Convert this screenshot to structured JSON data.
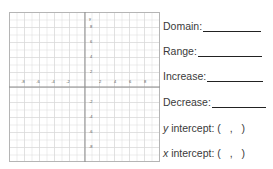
{
  "worksheet": {
    "fields": [
      {
        "label": "Domain:",
        "blank_width": 58
      },
      {
        "label": "Range:",
        "blank_width": 64
      },
      {
        "label": "Increase:",
        "blank_width": 56
      },
      {
        "label": "Decrease:",
        "blank_width": 54
      }
    ],
    "intercepts": [
      {
        "variable": "y",
        "label": " intercept:",
        "value": "(  ,  )"
      },
      {
        "variable": "x",
        "label": " intercept:",
        "value": "(  ,  )"
      }
    ]
  },
  "graph": {
    "axis_label_y": "y",
    "x_ticks_negative": [
      "-8",
      "-6",
      "-4",
      "-2"
    ],
    "x_ticks_positive": [
      "2",
      "4",
      "6",
      "8"
    ],
    "y_ticks_positive": [
      "8",
      "6",
      "4",
      "2"
    ],
    "y_ticks_negative": [
      "-2",
      "-4",
      "-6",
      "-8"
    ],
    "grid_color": "#d9d9d9",
    "axis_color": "#8a8a8a",
    "border_color": "#b5b5b5"
  }
}
